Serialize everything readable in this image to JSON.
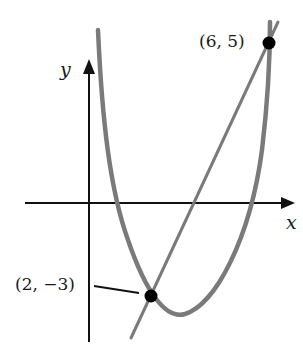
{
  "diagram": {
    "type": "parabola-line-intersection",
    "axes": {
      "x_label": "x",
      "y_label": "y"
    },
    "points": [
      {
        "label": "(6, 5)",
        "x": 6,
        "y": 5
      },
      {
        "label": "(2, −3)",
        "x": 2,
        "y": -3
      }
    ],
    "curves": [
      {
        "kind": "parabola",
        "description": "upward-opening parabola through both points"
      },
      {
        "kind": "line",
        "description": "secant line through (2, -3) and (6, 5)"
      }
    ],
    "colors": {
      "curve": "#7a7a7a",
      "axis": "#111111",
      "point": "#000000",
      "background": "#ffffff"
    }
  }
}
